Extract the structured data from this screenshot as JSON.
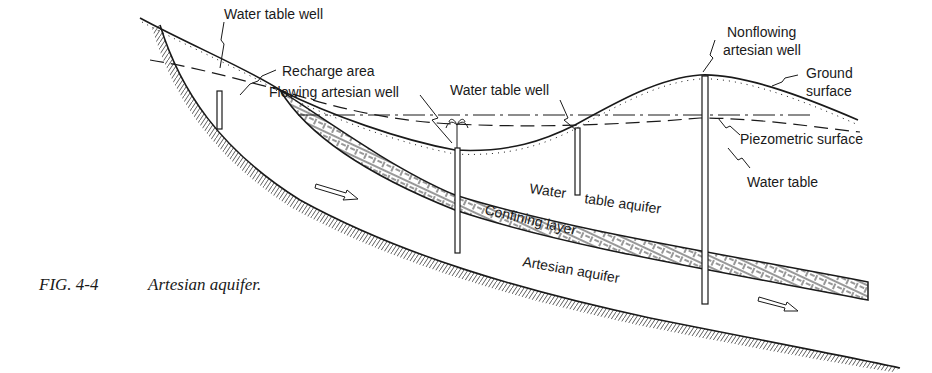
{
  "figure": {
    "caption_number": "FIG. 4-4",
    "caption_title": "Artesian aquifer."
  },
  "labels": {
    "water_table_well_left": "Water table well",
    "recharge_area": "Recharge area",
    "flowing_artesian_well": "Flowing artesian well",
    "water_table_well_center": "Water table well",
    "nonflowing_line1": "Nonflowing",
    "nonflowing_line2": "artesian well",
    "ground_line1": "Ground",
    "ground_line2": "surface",
    "piezometric_surface": "Piezometric surface",
    "water_table": "Water table",
    "water_table_aquifer_a": "Water",
    "water_table_aquifer_b": "table aquifer",
    "confining_layer": "Confining layer",
    "artesian_aquifer": "Artesian aquifer"
  },
  "colors": {
    "ink": "#1a1a1a",
    "background": "#ffffff"
  }
}
